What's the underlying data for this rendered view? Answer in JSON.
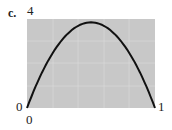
{
  "panel_label": "c.",
  "y_top_label": "4",
  "y_bottom_label": "0",
  "x_left_label": "0",
  "x_right_label": "1",
  "colors": {
    "plot_bg": "#c8c8c8",
    "curve": "#111111",
    "grid": "#e0e0e0"
  },
  "chart_data": {
    "type": "line",
    "title": "c.",
    "xlabel": "",
    "ylabel": "",
    "xlim": [
      0,
      1
    ],
    "ylim": [
      0,
      4
    ],
    "grid": true,
    "x": [
      0,
      0.1,
      0.2,
      0.3,
      0.4,
      0.5,
      0.6,
      0.7,
      0.8,
      0.9,
      1.0
    ],
    "series": [
      {
        "name": "curve",
        "values": [
          0,
          1.39,
          2.46,
          3.23,
          3.7,
          3.85,
          3.7,
          3.23,
          2.46,
          1.39,
          0
        ]
      }
    ],
    "tick_labels": {
      "x": [
        "0",
        "1"
      ],
      "y": [
        "0",
        "4"
      ]
    }
  }
}
